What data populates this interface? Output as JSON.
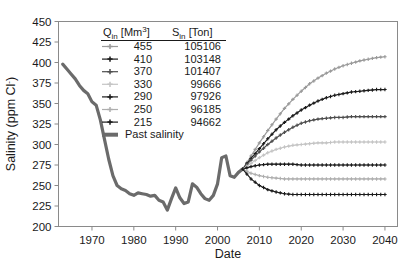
{
  "chart_data": {
    "type": "line",
    "title": "",
    "xlabel": "Date",
    "ylabel": "Salinity (ppm Cl-)",
    "ylabel_parts": {
      "main": "Salinity (ppm Cl",
      "sup": "-",
      "tail": ")"
    },
    "xlim": [
      1962,
      2043
    ],
    "ylim": [
      200,
      450
    ],
    "yticks": [
      200,
      225,
      250,
      275,
      300,
      325,
      350,
      375,
      400,
      425,
      450
    ],
    "xticks": [
      1970,
      1980,
      1990,
      2000,
      2010,
      2020,
      2030,
      2040
    ],
    "grid": false,
    "legend_position": "upper-center-left",
    "legend_headers": {
      "q": "Q_in [Mm3]",
      "q_base": "Q",
      "q_sub": "in",
      "q_unit": "[Mm",
      "q_sup": "3",
      "q_unit_end": "]",
      "s": "S_in [Ton]",
      "s_base": "S",
      "s_sub": "in",
      "s_unit": "[Ton]"
    },
    "series": [
      {
        "name": "455",
        "q_in": 455,
        "s_in": 105106,
        "color": "#9a9a9a",
        "marker": "plus",
        "end_value": 407,
        "x": [
          2006,
          2008,
          2010,
          2012,
          2014,
          2016,
          2018,
          2020,
          2022,
          2024,
          2026,
          2028,
          2030,
          2032,
          2034,
          2036,
          2038,
          2040
        ],
        "values": [
          270,
          286,
          302,
          317,
          331,
          344,
          355,
          365,
          374,
          381,
          387,
          392,
          396,
          399,
          402,
          404,
          406,
          407
        ]
      },
      {
        "name": "410",
        "q_in": 410,
        "s_in": 103148,
        "color": "#1a1a1a",
        "marker": "plus",
        "end_value": 367,
        "x": [
          2006,
          2008,
          2010,
          2012,
          2014,
          2016,
          2018,
          2020,
          2022,
          2024,
          2026,
          2028,
          2030,
          2032,
          2034,
          2036,
          2038,
          2040
        ],
        "values": [
          270,
          283,
          295,
          307,
          318,
          327,
          335,
          342,
          348,
          353,
          357,
          360,
          362,
          364,
          365,
          366,
          367,
          367
        ]
      },
      {
        "name": "370",
        "q_in": 370,
        "s_in": 101407,
        "color": "#4d4d4d",
        "marker": "plus",
        "end_value": 334,
        "x": [
          2006,
          2008,
          2010,
          2012,
          2014,
          2016,
          2018,
          2020,
          2022,
          2024,
          2026,
          2028,
          2030,
          2032,
          2034,
          2036,
          2038,
          2040
        ],
        "values": [
          270,
          281,
          291,
          300,
          308,
          315,
          321,
          326,
          329,
          331,
          332,
          333,
          333,
          334,
          334,
          334,
          334,
          334
        ]
      },
      {
        "name": "330",
        "q_in": 330,
        "s_in": 99666,
        "color": "#c4c4c4",
        "marker": "plus",
        "end_value": 303,
        "x": [
          2006,
          2008,
          2010,
          2012,
          2014,
          2016,
          2018,
          2020,
          2022,
          2024,
          2026,
          2028,
          2030,
          2032,
          2034,
          2036,
          2038,
          2040
        ],
        "values": [
          270,
          277,
          284,
          290,
          294,
          297,
          299,
          300,
          301,
          302,
          302,
          303,
          303,
          303,
          303,
          303,
          303,
          303
        ]
      },
      {
        "name": "290",
        "q_in": 290,
        "s_in": 97926,
        "color": "#1a1a1a",
        "marker": "plus",
        "end_value": 275,
        "x": [
          2006,
          2008,
          2010,
          2012,
          2014,
          2016,
          2018,
          2020,
          2022,
          2024,
          2026,
          2028,
          2030,
          2032,
          2034,
          2036,
          2038,
          2040
        ],
        "values": [
          270,
          273,
          275,
          276,
          276,
          276,
          276,
          275,
          275,
          275,
          275,
          275,
          275,
          275,
          275,
          275,
          275,
          275
        ]
      },
      {
        "name": "250",
        "q_in": 250,
        "s_in": 96185,
        "color": "#aeaeae",
        "marker": "plus",
        "end_value": 258,
        "x": [
          2006,
          2008,
          2010,
          2012,
          2014,
          2016,
          2018,
          2020,
          2022,
          2024,
          2026,
          2028,
          2030,
          2032,
          2034,
          2036,
          2038,
          2040
        ],
        "values": [
          270,
          265,
          262,
          260,
          259,
          258,
          258,
          258,
          258,
          258,
          258,
          258,
          258,
          258,
          258,
          258,
          258,
          258
        ]
      },
      {
        "name": "215",
        "q_in": 215,
        "s_in": 94662,
        "color": "#1a1a1a",
        "marker": "plus",
        "end_value": 239,
        "x": [
          2006,
          2008,
          2010,
          2012,
          2014,
          2016,
          2018,
          2020,
          2022,
          2024,
          2026,
          2028,
          2030,
          2032,
          2034,
          2036,
          2038,
          2040
        ],
        "values": [
          270,
          258,
          250,
          245,
          242,
          240,
          239,
          239,
          239,
          239,
          239,
          239,
          239,
          239,
          239,
          239,
          239,
          239
        ]
      }
    ],
    "past_series": {
      "name": "Past salinity",
      "color": "#6b6b6b",
      "x": [
        1963,
        1964,
        1965,
        1966,
        1967,
        1968,
        1969,
        1970,
        1971,
        1972,
        1973,
        1974,
        1975,
        1976,
        1977,
        1978,
        1979,
        1980,
        1981,
        1982,
        1983,
        1984,
        1985,
        1986,
        1987,
        1988,
        1989,
        1990,
        1991,
        1992,
        1993,
        1994,
        1995,
        1996,
        1997,
        1998,
        1999,
        2000,
        2001,
        2002,
        2003,
        2004,
        2005,
        2006
      ],
      "values": [
        398,
        392,
        386,
        380,
        372,
        366,
        362,
        352,
        348,
        330,
        306,
        282,
        262,
        250,
        246,
        244,
        240,
        238,
        241,
        240,
        239,
        237,
        238,
        232,
        230,
        220,
        234,
        247,
        235,
        228,
        230,
        252,
        248,
        240,
        234,
        232,
        238,
        252,
        284,
        286,
        262,
        260,
        266,
        270
      ]
    }
  }
}
